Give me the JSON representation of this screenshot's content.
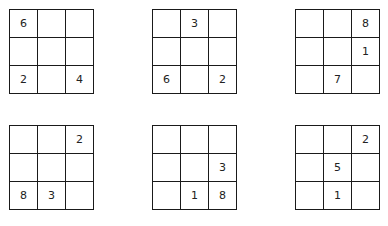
{
  "puzzles": [
    {
      "cells": [
        "6",
        "",
        "",
        "",
        "",
        "",
        "2",
        "",
        "4"
      ]
    },
    {
      "cells": [
        "",
        "3",
        "",
        "",
        "",
        "",
        "6",
        "",
        "2"
      ]
    },
    {
      "cells": [
        "",
        "",
        "8",
        "",
        "",
        "1",
        "",
        "7",
        ""
      ]
    },
    {
      "cells": [
        "",
        "",
        "2",
        "",
        "",
        "",
        "8",
        "3",
        ""
      ]
    },
    {
      "cells": [
        "",
        "",
        "",
        "",
        "",
        "3",
        "",
        "1",
        "8"
      ]
    },
    {
      "cells": [
        "",
        "",
        "2",
        "",
        "5",
        "",
        "",
        "1",
        ""
      ]
    }
  ],
  "colors": {
    "grid_line": "#1a1a1a",
    "digit": "#222222",
    "background": "#ffffff"
  }
}
